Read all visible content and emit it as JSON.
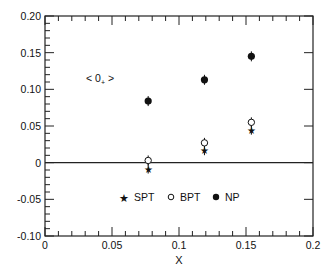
{
  "chart_data": {
    "type": "scatter",
    "title": "",
    "xlabel": "X",
    "ylabel": "",
    "annotation": "< 0+ >",
    "xlim": [
      0,
      0.2
    ],
    "ylim": [
      -0.1,
      0.2
    ],
    "x_ticks": [
      "0",
      "0.05",
      "0.1",
      "0.15",
      "0.2"
    ],
    "y_ticks": [
      "0.20",
      "0.15",
      "0.10",
      "0.05",
      "0",
      "-0.05",
      "-0.10"
    ],
    "grid": false,
    "legend_position": "inside-bottom-center",
    "series": [
      {
        "name": "SPT",
        "marker": "star",
        "x": [
          0.077,
          0.119,
          0.154
        ],
        "values": [
          -0.008,
          0.017,
          0.045
        ]
      },
      {
        "name": "BPT",
        "marker": "open-circle",
        "x": [
          0.077,
          0.119,
          0.154
        ],
        "values": [
          0.003,
          0.027,
          0.055
        ]
      },
      {
        "name": "NP",
        "marker": "filled-circle",
        "x": [
          0.077,
          0.119,
          0.154
        ],
        "values": [
          0.084,
          0.113,
          0.145
        ]
      }
    ]
  },
  "legend": {
    "spt": "SPT",
    "bpt": "BPT",
    "np": "NP"
  },
  "labels": {
    "annotation_main": "< 0",
    "annotation_sub": "+",
    "annotation_end": " >",
    "xlabel": "X"
  },
  "ticks": {
    "x": [
      "0",
      "0.05",
      "0.1",
      "0.15",
      "0.2"
    ],
    "y": [
      "0.20",
      "0.15",
      "0.10",
      "0.05",
      "0",
      "-0.05",
      "-0.10"
    ]
  }
}
